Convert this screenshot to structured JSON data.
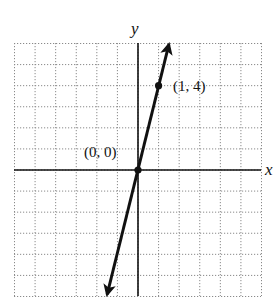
{
  "chart_data": {
    "type": "line",
    "title": "",
    "xlabel": "x",
    "ylabel": "y",
    "xlim": [
      -6,
      6
    ],
    "ylim": [
      -6,
      6
    ],
    "grid": true,
    "grid_step": 1,
    "tick_labels_shown": false,
    "series": [
      {
        "name": "y = 4x",
        "equation": "y = 4x",
        "x": [
          -1.5,
          0,
          1,
          1.5
        ],
        "y": [
          -6,
          0,
          4,
          6
        ],
        "arrows_both_ends": true
      }
    ],
    "points": [
      {
        "x": 0,
        "y": 0,
        "label": "(0, 0)"
      },
      {
        "x": 1,
        "y": 4,
        "label": "(1, 4)"
      }
    ]
  },
  "labels": {
    "x_axis": "x",
    "y_axis": "y",
    "origin_point": "(0, 0)",
    "point_1_4": "(1, 4)"
  },
  "colors": {
    "line": "#111111",
    "grid": "#8a8a8a",
    "background": "#ffffff"
  }
}
